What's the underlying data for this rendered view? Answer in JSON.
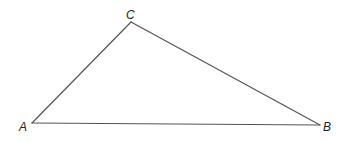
{
  "diagram": {
    "type": "triangle",
    "stroke_color": "#555555",
    "label_color": "#222222",
    "vertices": [
      {
        "id": "A",
        "label": "A",
        "x": 32,
        "y": 123,
        "label_x": 19,
        "label_y": 131
      },
      {
        "id": "B",
        "label": "B",
        "x": 320,
        "y": 125,
        "label_x": 323,
        "label_y": 131
      },
      {
        "id": "C",
        "label": "C",
        "x": 131,
        "y": 22,
        "label_x": 126,
        "label_y": 19
      }
    ],
    "sides": [
      {
        "id": "AB",
        "from": "A",
        "to": "B"
      },
      {
        "id": "BC",
        "from": "B",
        "to": "C"
      },
      {
        "id": "CA",
        "from": "C",
        "to": "A"
      }
    ]
  }
}
